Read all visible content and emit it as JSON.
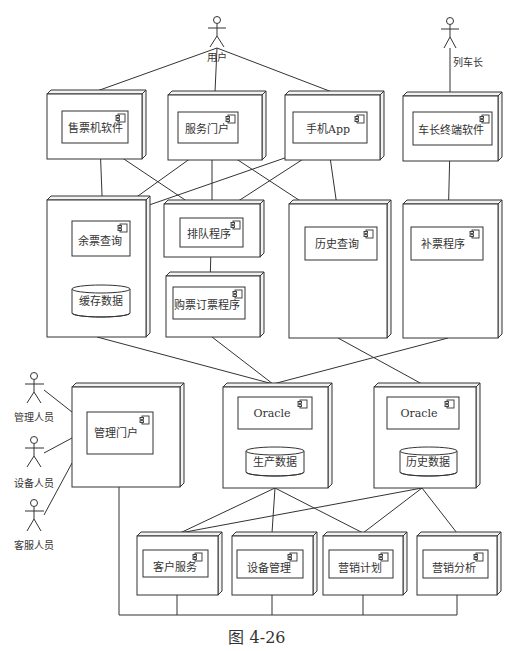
{
  "diagram": {
    "type": "UML deployment diagram",
    "caption": "图 4-26"
  },
  "actors": {
    "user": "用户",
    "conductor": "列车长",
    "admin": "管理人员",
    "equipment": "设备人员",
    "service": "客服人员"
  },
  "components": {
    "ticket_machine": "售票机软件",
    "service_portal": "服务门户",
    "mobile_app": "手机App",
    "conductor_terminal": "车长终端软件",
    "remaining_query": "余票查询",
    "queue_program": "排队程序",
    "booking_program": "购票订票程序",
    "history_query": "历史查询",
    "supplement_program": "补票程序",
    "admin_portal": "管理门户",
    "oracle_production": "Oracle",
    "oracle_history": "Oracle",
    "customer_service": "客户服务",
    "equipment_management": "设备管理",
    "marketing_plan": "营销计划",
    "marketing_analysis": "营销分析"
  },
  "databases": {
    "cache": "缓存数据",
    "production": "生产数据",
    "history": "历史数据"
  },
  "colors": {
    "line": "#333333",
    "background": "#ffffff"
  }
}
